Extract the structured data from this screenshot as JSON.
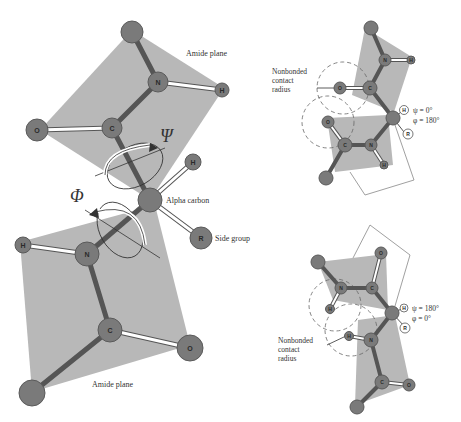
{
  "figure": {
    "colors": {
      "plane": "#b8b8b8",
      "atom": "#7a7a7a",
      "atom_stroke": "#555555",
      "bond_dark": "#5a5a5a",
      "bond_light": "#ffffff",
      "text": "#333333"
    },
    "left": {
      "labels": {
        "amide_plane_top": "Amide plane",
        "amide_plane_bottom": "Amide plane",
        "alpha_carbon": "Alpha carbon",
        "side_group": "Side group",
        "psi": "Ψ",
        "phi": "Φ"
      },
      "atoms": {
        "n_top": "N",
        "h_top": "H",
        "o_top": "O",
        "c_top": "C",
        "h_alpha": "H",
        "r_side": "R",
        "h_bottom": "H",
        "n_bottom": "N",
        "c_bottom": "C",
        "o_bottom": "O"
      }
    },
    "right_top": {
      "label_contact": [
        "Nonbonded",
        "contact",
        "radius"
      ],
      "angle_psi": "ψ = 0°",
      "angle_phi": "φ = 180°",
      "atoms": {
        "n1": "N",
        "h1": "H",
        "c1": "C",
        "o1": "O",
        "o2": "O",
        "c2": "C",
        "n2": "N",
        "h2": "H",
        "h_alpha": "H",
        "r": "R"
      }
    },
    "right_bottom": {
      "label_contact": [
        "Nonbonded",
        "contact",
        "radius"
      ],
      "angle_psi": "ψ = 180°",
      "angle_phi": "φ = 0°",
      "atoms": {
        "o1": "O",
        "n1": "N",
        "c1": "C",
        "h1": "H",
        "h2": "H",
        "n2": "N",
        "c2": "C",
        "o2": "O",
        "h_alpha": "H",
        "r": "R"
      }
    }
  }
}
